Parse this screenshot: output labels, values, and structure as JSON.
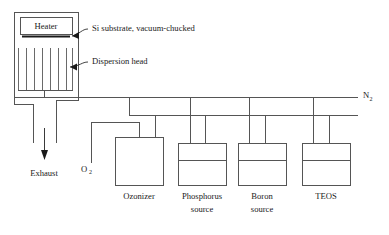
{
  "diagram": {
    "chamber": {
      "heater_label": "Heater",
      "substrate_label": "Si substrate, vacuum-chucked",
      "dispersion_label": "Dispersion head",
      "fin_count": 7
    },
    "flows": {
      "exhaust_label": "Exhaust",
      "oxygen_label": "O",
      "oxygen_sub": "2",
      "nitrogen_label": "N",
      "nitrogen_sub": "2"
    },
    "vessels": [
      {
        "name": "ozonizer",
        "label_line1": "Ozonizer",
        "label_line2": "",
        "has_liquid": false
      },
      {
        "name": "phosphorus-source",
        "label_line1": "Phosphorus",
        "label_line2": "source",
        "has_liquid": true
      },
      {
        "name": "boron-source",
        "label_line1": "Boron",
        "label_line2": "source",
        "has_liquid": true
      },
      {
        "name": "teos-source",
        "label_line1": "TEOS",
        "label_line2": "",
        "has_liquid": true
      }
    ],
    "colors": {
      "line": "#555555",
      "line_dark": "#3a3a3a",
      "text": "#1a1a1a",
      "background": "#ffffff"
    }
  }
}
